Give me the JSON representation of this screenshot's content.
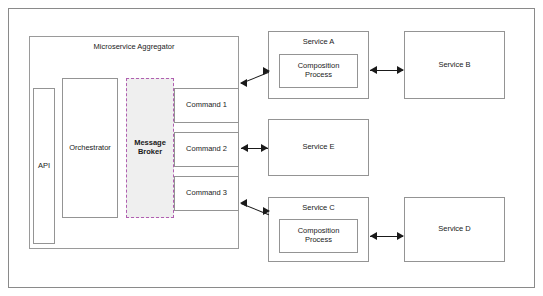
{
  "diagram": {
    "title": "",
    "aggregator": {
      "label": "Microservice Aggregator",
      "api": "API",
      "orchestrator": "Orchestrator",
      "message_broker": "Message\nBroker",
      "message_broker_line1": "Message",
      "message_broker_line2": "Broker",
      "commands": [
        {
          "label": "Command 1"
        },
        {
          "label": "Command 2"
        },
        {
          "label": "Command 3"
        }
      ]
    },
    "services": [
      {
        "label": "Service A",
        "inner": "Composition\nProcess",
        "inner_line1": "Composition",
        "inner_line2": "Process"
      },
      {
        "label": "Service B",
        "inner": ""
      },
      {
        "label": "Service E",
        "inner": ""
      },
      {
        "label": "Service C",
        "inner": "Composition\nProcess",
        "inner_line1": "Composition",
        "inner_line2": "Process"
      },
      {
        "label": "Service D",
        "inner": ""
      }
    ],
    "colors": {
      "border": "#949494",
      "broker_fill": "#efefef",
      "broker_border": "#b05fb0",
      "arrow": "#1a1a1a",
      "background": "#ffffff"
    }
  }
}
